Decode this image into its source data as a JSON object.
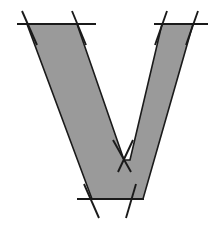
{
  "figure": {
    "canvas": {
      "width": 219,
      "height": 225,
      "background": "#ffffff"
    },
    "colors": {
      "fill": "#9a9a9a",
      "stroke": "#1a1a1a",
      "background": "#ffffff"
    },
    "strokes": {
      "outline_width": 1.6,
      "guide_width": 1.9
    },
    "v_shape": {
      "name": "letter-v-polygon",
      "description": "Filled gray V glyph, left arm thick, right arm narrow",
      "points": "27,24 77,24 124,160 130,160 162,24 193,24 143,199 92,199"
    },
    "guides": [
      {
        "name": "top-left-horizontal-guide",
        "type": "horizontal",
        "x1": 17,
        "y1": 24,
        "x2": 96,
        "y2": 24
      },
      {
        "name": "top-left-first-diagonal-guide",
        "type": "diagonal",
        "x1": 22,
        "y1": 11,
        "x2": 37,
        "y2": 45
      },
      {
        "name": "top-left-second-diagonal-guide",
        "type": "diagonal",
        "x1": 72,
        "y1": 11,
        "x2": 86,
        "y2": 45
      },
      {
        "name": "top-right-horizontal-guide",
        "type": "horizontal",
        "x1": 154,
        "y1": 24,
        "x2": 208,
        "y2": 24
      },
      {
        "name": "top-right-first-diagonal-guide",
        "type": "diagonal",
        "x1": 167,
        "y1": 11,
        "x2": 155,
        "y2": 45
      },
      {
        "name": "top-right-second-diagonal-guide",
        "type": "diagonal",
        "x1": 198,
        "y1": 11,
        "x2": 186,
        "y2": 45
      },
      {
        "name": "bottom-horizontal-guide",
        "type": "horizontal",
        "x1": 77,
        "y1": 199,
        "x2": 144,
        "y2": 199
      },
      {
        "name": "bottom-left-diagonal-guide",
        "type": "diagonal",
        "x1": 84,
        "y1": 184,
        "x2": 99,
        "y2": 218
      },
      {
        "name": "bottom-right-diagonal-guide",
        "type": "diagonal",
        "x1": 136,
        "y1": 184,
        "x2": 126,
        "y2": 218
      },
      {
        "name": "vertex-cross-left-stroke",
        "type": "diagonal",
        "x1": 113,
        "y1": 140,
        "x2": 131,
        "y2": 172
      },
      {
        "name": "vertex-cross-right-stroke",
        "type": "diagonal",
        "x1": 133,
        "y1": 140,
        "x2": 118,
        "y2": 172
      }
    ]
  }
}
